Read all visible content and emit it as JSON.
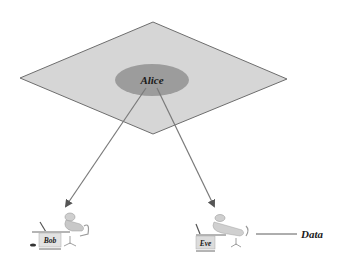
{
  "diagram": {
    "plane": {
      "label": "",
      "fill": "#d4d4d4",
      "stroke": "#6e6e6e"
    },
    "center_node": {
      "label": "Alice",
      "fill": "#9a9a9a"
    },
    "nodes": [
      {
        "label": "Bob"
      },
      {
        "label": "Eve"
      }
    ],
    "edges": [
      {
        "from": "Alice",
        "to": "Bob"
      },
      {
        "from": "Alice",
        "to": "Eve"
      }
    ],
    "annotation": {
      "label": "Data",
      "target": "Eve"
    },
    "colors": {
      "arrow": "#7a7a7a",
      "text": "#1a1a1a"
    }
  }
}
